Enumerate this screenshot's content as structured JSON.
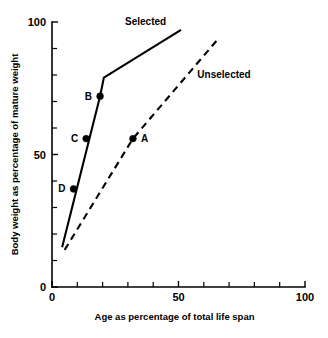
{
  "chart_data": {
    "type": "line",
    "title": "",
    "xlabel": "Age as percentage of total life span",
    "ylabel": "Body weight as percentage of mature weight",
    "xlim": [
      0,
      100
    ],
    "ylim": [
      0,
      100
    ],
    "grid": false,
    "legend_position": "inline-annotation",
    "xticks": [
      0,
      10,
      20,
      30,
      40,
      50,
      60,
      70,
      80,
      90,
      100
    ],
    "xticklabels": [
      "0",
      "",
      "",
      "",
      "",
      "50",
      "",
      "",
      "",
      "",
      "100"
    ],
    "xtick_major_labeled": [
      "0",
      "50",
      "100"
    ],
    "yticks": [
      0,
      10,
      20,
      30,
      40,
      50,
      60,
      70,
      80,
      90,
      100
    ],
    "yticklabels": [
      "0",
      "",
      "",
      "",
      "",
      "50",
      "",
      "",
      "",
      "",
      "100"
    ],
    "ytick_major_labeled": [
      "0",
      "50",
      "100"
    ],
    "series": [
      {
        "name": "Selected",
        "style": "solid",
        "label_x": 37,
        "label_y": 99,
        "x": [
          4,
          19,
          20.5,
          51
        ],
        "y": [
          15,
          72,
          79,
          97
        ]
      },
      {
        "name": "Unselected",
        "style": "dashed",
        "label_x": 68,
        "label_y": 79,
        "x": [
          5,
          32,
          66
        ],
        "y": [
          14,
          56,
          94
        ]
      }
    ],
    "annotations": [
      {
        "label": "A",
        "x": 32,
        "y": 56,
        "label_side": "right",
        "series": "Unselected"
      },
      {
        "label": "B",
        "x": 19,
        "y": 72,
        "label_side": "left",
        "series": "Selected"
      },
      {
        "label": "C",
        "x": 13.5,
        "y": 56,
        "label_side": "left",
        "series": "Selected"
      },
      {
        "label": "D",
        "x": 8.5,
        "y": 37,
        "label_side": "left",
        "series": "Selected"
      }
    ],
    "colors": {
      "axis": "#000000",
      "selected_line": "#000000",
      "unselected_line": "#000000",
      "background": "#ffffff"
    }
  }
}
